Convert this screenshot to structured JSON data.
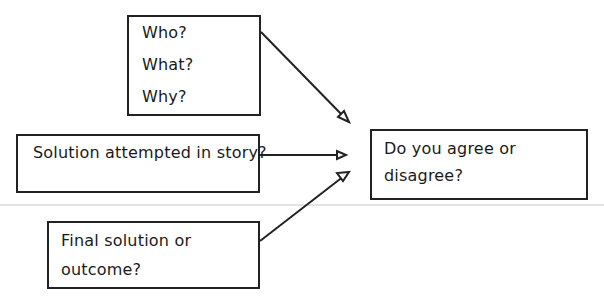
{
  "diagram": {
    "box_questions": {
      "lines": [
        "Who?",
        "What?",
        "Why?"
      ]
    },
    "box_attempted": {
      "text": "Solution attempted in story?"
    },
    "box_final": {
      "line1": "Final solution or",
      "line2": "outcome?"
    },
    "box_opinion": {
      "line1": "Do you agree or",
      "line2": "disagree?"
    },
    "edges": [
      {
        "from": "box_questions",
        "to": "box_opinion"
      },
      {
        "from": "box_attempted",
        "to": "box_opinion"
      },
      {
        "from": "box_final",
        "to": "box_opinion"
      }
    ]
  }
}
